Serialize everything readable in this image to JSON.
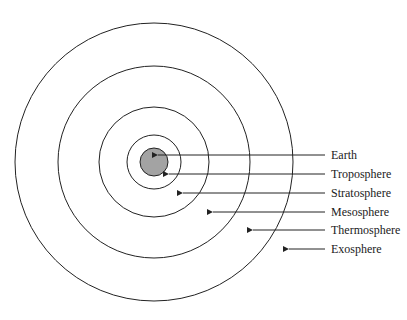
{
  "diagram": {
    "colors": {
      "line": "#222222",
      "earth_fill": "#a3a3a3",
      "background": "#ffffff"
    },
    "center": [
      154,
      162
    ],
    "circles": [
      {
        "name": "earth",
        "r": 14,
        "filled": true
      },
      {
        "name": "troposphere-boundary",
        "r": 27
      },
      {
        "name": "stratosphere-boundary",
        "r": 55
      },
      {
        "name": "mesosphere-boundary",
        "r": 96
      },
      {
        "name": "thermosphere-boundary",
        "r": 139
      }
    ],
    "labels": [
      {
        "text": "Earth",
        "y": 155,
        "arrow_tip_x": 157
      },
      {
        "text": "Troposphere",
        "y": 174,
        "arrow_tip_x": 168
      },
      {
        "text": "Stratosphere",
        "y": 193,
        "arrow_tip_x": 182
      },
      {
        "text": "Mesosphere",
        "y": 212,
        "arrow_tip_x": 212
      },
      {
        "text": "Thermosphere",
        "y": 230,
        "arrow_tip_x": 252
      },
      {
        "text": "Exosphere",
        "y": 249,
        "arrow_tip_x": 288
      }
    ]
  }
}
